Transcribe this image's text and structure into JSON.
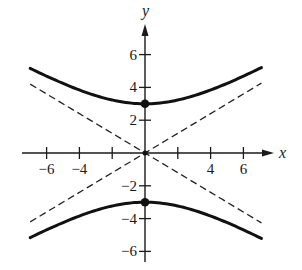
{
  "chart_data": {
    "type": "line",
    "title": "",
    "xlabel": "x",
    "ylabel": "y",
    "equation": "y^2/9 - x^2/25 = 1",
    "xlim": [
      -7,
      7.5
    ],
    "ylim": [
      -6.6,
      7.8
    ],
    "x_ticks": [
      -6,
      -4,
      -2,
      2,
      4,
      6
    ],
    "x_tick_labels": [
      "−6",
      "−4",
      "",
      "4",
      "6"
    ],
    "x_tick_labels_map": [
      {
        "value": -6,
        "label": "−6"
      },
      {
        "value": -4,
        "label": "−4"
      },
      {
        "value": -2,
        "label": ""
      },
      {
        "value": 2,
        "label": ""
      },
      {
        "value": 4,
        "label": "4"
      },
      {
        "value": 6,
        "label": "6"
      }
    ],
    "y_ticks_map": [
      {
        "value": 6,
        "label": "6"
      },
      {
        "value": 4,
        "label": "4"
      },
      {
        "value": 2,
        "label": "2"
      },
      {
        "value": -2,
        "label": "−2"
      },
      {
        "value": -4,
        "label": "−4"
      },
      {
        "value": -6,
        "label": "−6"
      }
    ],
    "grid": false,
    "legend": null,
    "series": [
      {
        "name": "hyperbola upper branch",
        "style": "solid-thick",
        "a": 3,
        "b": 5,
        "branch": "upper",
        "x_range": [
          -7,
          7.1
        ]
      },
      {
        "name": "hyperbola lower branch",
        "style": "solid-thick",
        "a": 3,
        "b": 5,
        "branch": "lower",
        "x_range": [
          -7,
          7.1
        ]
      },
      {
        "name": "asymptote y = 3x/5",
        "style": "dashed",
        "slope": 0.6,
        "x_range": [
          -7,
          7.1
        ]
      },
      {
        "name": "asymptote y = -3x/5",
        "style": "dashed",
        "slope": -0.6,
        "x_range": [
          -7,
          7.1
        ]
      }
    ],
    "points": [
      {
        "name": "vertex-upper",
        "x": 0,
        "y": 3
      },
      {
        "name": "vertex-lower",
        "x": 0,
        "y": -3
      },
      {
        "name": "center",
        "x": 0,
        "y": 0
      }
    ]
  },
  "layout": {
    "origin_px": [
      145,
      153
    ],
    "unit_px": 16.4,
    "x_axis_px": [
      22,
      274
    ],
    "y_axis_px": [
      262,
      24
    ],
    "colors": {
      "curve": "#111111",
      "axis": "#1a1a1a",
      "asymptote": "#222222"
    }
  }
}
